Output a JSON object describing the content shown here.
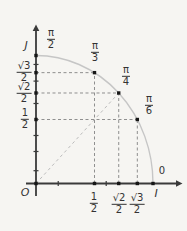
{
  "figure": {
    "background": "#f6f5f2",
    "colors": {
      "axis": "#3a3a3a",
      "arc": "#c6c6c6",
      "dash": "#8f8f8f",
      "diagonal_dash": "#bcbcbc",
      "point": "#161616",
      "text": "#333333"
    },
    "letters": {
      "origin": "O",
      "x_axis": "I",
      "y_axis": "J",
      "zero": "0"
    },
    "angle_labels": [
      {
        "num": "π",
        "den": "2",
        "cos": 0,
        "sin": 1
      },
      {
        "num": "π",
        "den": "3",
        "cos": 0.5,
        "sin": 0.866
      },
      {
        "num": "π",
        "den": "4",
        "cos": 0.7071,
        "sin": 0.7071
      },
      {
        "num": "π",
        "den": "6",
        "cos": 0.866,
        "sin": 0.5
      }
    ],
    "y_value_labels": [
      {
        "num": "√3",
        "den": "2",
        "value": 0.866
      },
      {
        "num": "√2",
        "den": "2",
        "value": 0.7071
      },
      {
        "num": "1",
        "den": "2",
        "value": 0.5
      }
    ],
    "x_value_labels": [
      {
        "num": "1",
        "den": "2",
        "value": 0.5
      },
      {
        "num": "√2",
        "den": "2",
        "value": 0.7071
      },
      {
        "num": "√3",
        "den": "2",
        "value": 0.866
      }
    ]
  }
}
